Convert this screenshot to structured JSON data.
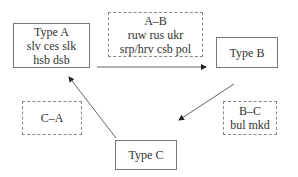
{
  "diagram": {
    "nodes": [
      {
        "id": "type_a",
        "title": "Type A",
        "lines": [
          "slv ces slk",
          "hsb dsb"
        ]
      },
      {
        "id": "type_b",
        "title": "Type B",
        "lines": []
      },
      {
        "id": "type_c",
        "title": "Type C",
        "lines": []
      }
    ],
    "transitions": [
      {
        "id": "a_b",
        "label": "A–B",
        "lines": [
          "ruw rus ukr",
          "srp/hrv csb pol"
        ],
        "from": "Type A",
        "to": "Type B"
      },
      {
        "id": "b_c",
        "label": "B–C",
        "lines": [
          "bul mkd"
        ],
        "from": "Type B",
        "to": "Type C"
      },
      {
        "id": "c_a",
        "label": "C–A",
        "lines": [],
        "from": "Type C",
        "to": "Type A"
      }
    ],
    "colors": {
      "line": "#666666",
      "border": "#777777",
      "text": "#333333"
    }
  }
}
